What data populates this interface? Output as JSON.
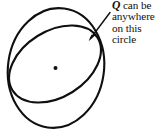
{
  "figure": {
    "caption_lines": [
      "can be",
      "anywhere",
      "on this",
      "circle"
    ],
    "variable_label": "Q",
    "colors": {
      "stroke": "#100f0d",
      "background": "#ffffff",
      "text": "#100f0d"
    },
    "stroke_width": 2.1,
    "elements": {
      "outer_ellipse_name": "large-circle-outline",
      "inner_ellipse_name": "tilted-circle-outline",
      "center_point_name": "center-dot",
      "leader_name": "leader-arrow"
    },
    "geometry": {
      "outer_ellipse": {
        "cx": 56,
        "cy": 68,
        "rx": 48,
        "ry": 60,
        "rotation": 8
      },
      "inner_ellipse": {
        "cx": 55,
        "cy": 64,
        "rx": 50,
        "ry": 33,
        "rotation": -32
      },
      "center_dot": {
        "cx": 55.5,
        "cy": 68,
        "r": 2.0
      },
      "leader_line": {
        "x1": 110,
        "y1": 12,
        "x2": 89,
        "y2": 40
      },
      "arrow_head": "89,40 95,34 88,35 90,29"
    }
  }
}
